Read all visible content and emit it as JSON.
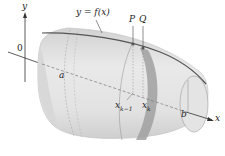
{
  "diagram": {
    "labels": {
      "y_axis": "y",
      "x_axis": "x",
      "origin": "0",
      "curve": "y = f(x)",
      "point_p": "P",
      "point_q": "Q",
      "a": "a",
      "b": "b",
      "x_k_minus_1": "x",
      "x_k_minus_1_sub": "k−1",
      "x_k": "x",
      "x_k_sub": "k"
    },
    "colors": {
      "surface_light": "#e6e6e6",
      "surface_mid": "#d0d0d0",
      "surface_shadow": "#bdbdbd",
      "band": "#9a9a9a",
      "curve": "#555555",
      "axis": "#333333"
    }
  }
}
